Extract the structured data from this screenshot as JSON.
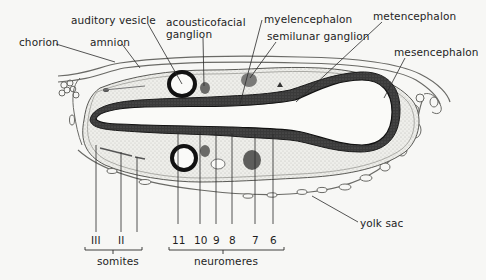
{
  "figure": {
    "type": "embryo cross-section diagram",
    "background": "#f7f7f5",
    "ink_color": "#1e1e1e",
    "neural_tube_color": "#2b2b2b",
    "mesenchyme_stipple_color": "#d9d9d4"
  },
  "labels": {
    "chorion": "chorion",
    "amnion": "amnion",
    "auditory_vesicle": "auditory vesicle",
    "acousticofacial_line1": "acousticofacial",
    "acousticofacial_line2": "ganglion",
    "myelencephalon": "myelencephalon",
    "semilunar_ganglion": "semilunar ganglion",
    "metencephalon": "metencephalon",
    "mesencephalon": "mesencephalon",
    "yolk_sac": "yolk sac"
  },
  "somites": {
    "group_label": "somites",
    "items": [
      "III",
      "II"
    ]
  },
  "neuromeres": {
    "group_label": "neuromeres",
    "items": [
      "11",
      "10",
      "9",
      "8",
      "7",
      "6"
    ]
  }
}
